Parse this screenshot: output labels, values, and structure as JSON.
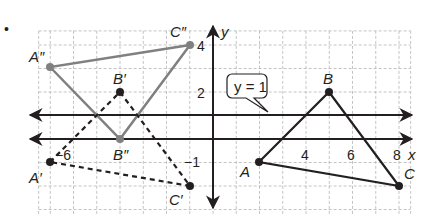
{
  "diagram": {
    "bullet": "•",
    "grid": {
      "x_min": -7.5,
      "x_max": 8.5,
      "y_min": -3.3,
      "y_max": 4.6,
      "step": 1,
      "style": "dashed"
    },
    "axes": {
      "x_label": "x",
      "y_label": "y"
    },
    "x_ticks": [
      {
        "value": -6,
        "label": "−6"
      },
      {
        "value": 4,
        "label": "4"
      },
      {
        "value": 6,
        "label": "6"
      },
      {
        "value": 8,
        "label": "8"
      }
    ],
    "y_ticks": [
      {
        "value": 4,
        "label": "4"
      },
      {
        "value": 2,
        "label": "2"
      },
      {
        "value": -1,
        "label": "−1"
      }
    ],
    "reflection_line": {
      "equation": "y = 1",
      "y": 1
    },
    "colors": {
      "original": "#231f20",
      "first_image": "#231f20",
      "second_image": "#808080",
      "grid": "#b5b5b5",
      "axis": "#231f20"
    },
    "triangles": [
      {
        "name": "ABC",
        "style": "solid-black",
        "vertices": [
          {
            "label": "A",
            "x": 2,
            "y": -1
          },
          {
            "label": "B",
            "x": 5,
            "y": 2
          },
          {
            "label": "C",
            "x": 8,
            "y": -2
          }
        ]
      },
      {
        "name": "A'B'C'",
        "style": "dashed-black",
        "vertices": [
          {
            "label": "A′",
            "x": -7,
            "y": -1
          },
          {
            "label": "B′",
            "x": -4,
            "y": 2
          },
          {
            "label": "C′",
            "x": -1,
            "y": -2
          }
        ]
      },
      {
        "name": "A''B''C''",
        "style": "solid-gray",
        "vertices": [
          {
            "label": "A″",
            "x": -7,
            "y": 3
          },
          {
            "label": "B″",
            "x": -4,
            "y": 0
          },
          {
            "label": "C″",
            "x": -1,
            "y": 4
          }
        ]
      }
    ]
  }
}
